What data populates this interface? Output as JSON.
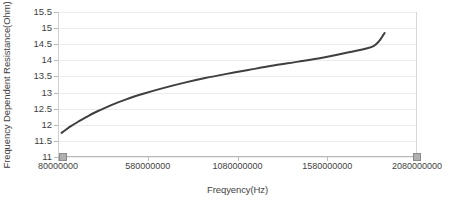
{
  "chart_data": {
    "type": "line",
    "title": "",
    "xlabel": "Freqyency(Hz)",
    "ylabel": "Frequency Dependent Resistance(Ohm)",
    "xlim": [
      80000000,
      2080000000
    ],
    "ylim": [
      11,
      15.5
    ],
    "grid": true,
    "legend": "none",
    "x_ticks": [
      80000000,
      580000000,
      1080000000,
      1580000000,
      2080000000
    ],
    "x_tick_labels": [
      "80000000",
      "580000000",
      "1080000000",
      "1580000000",
      "2080000000"
    ],
    "y_ticks": [
      11,
      11.5,
      12,
      12.5,
      13,
      13.5,
      14,
      14.5,
      15,
      15.5
    ],
    "y_tick_labels": [
      "11",
      "11.5",
      "12",
      "12.5",
      "13",
      "13.5",
      "14",
      "14.5",
      "15",
      "15.5"
    ],
    "series": [
      {
        "name": "Frequency Dependent Resistance",
        "color": "#3f3f3f",
        "x": [
          100000000,
          150000000,
          200000000,
          250000000,
          300000000,
          380000000,
          460000000,
          560000000,
          660000000,
          780000000,
          900000000,
          1020000000,
          1140000000,
          1280000000,
          1420000000,
          1560000000,
          1700000000,
          1840000000,
          1900000000
        ],
        "y": [
          11.75,
          11.95,
          12.12,
          12.28,
          12.42,
          12.62,
          12.79,
          12.97,
          13.13,
          13.3,
          13.45,
          13.58,
          13.7,
          13.84,
          13.96,
          14.09,
          14.25,
          14.45,
          14.85
        ]
      }
    ]
  },
  "axes": {
    "x_title": "Freqyency(Hz)",
    "y_title": "Frequency Dependent Resistance(Ohm)"
  }
}
